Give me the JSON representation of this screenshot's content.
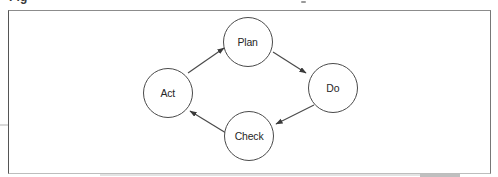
{
  "figure_caption": {
    "cropped_text": "Fig"
  },
  "diagram": {
    "title_visible": false,
    "nodes": [
      {
        "id": "plan",
        "label": "Plan",
        "cx": 248,
        "cy": 42,
        "r": 25
      },
      {
        "id": "do",
        "label": "Do",
        "cx": 333,
        "cy": 88,
        "r": 25
      },
      {
        "id": "check",
        "label": "Check",
        "cx": 249,
        "cy": 136,
        "r": 25
      },
      {
        "id": "act",
        "label": "Act",
        "cx": 168,
        "cy": 93,
        "r": 25
      }
    ],
    "edges": [
      {
        "from": "act",
        "to": "plan",
        "x1": 188,
        "y1": 73,
        "x2": 224,
        "y2": 48
      },
      {
        "from": "plan",
        "to": "do",
        "x1": 273,
        "y1": 52,
        "x2": 306,
        "y2": 73
      },
      {
        "from": "do",
        "to": "check",
        "x1": 314,
        "y1": 105,
        "x2": 276,
        "y2": 124
      },
      {
        "from": "check",
        "to": "act",
        "x1": 226,
        "y1": 133,
        "x2": 190,
        "y2": 111
      }
    ],
    "colors": {
      "stroke": "#4a4a4a",
      "text": "#262626",
      "frame": "#6a6a6a",
      "background": "#ffffff"
    }
  }
}
